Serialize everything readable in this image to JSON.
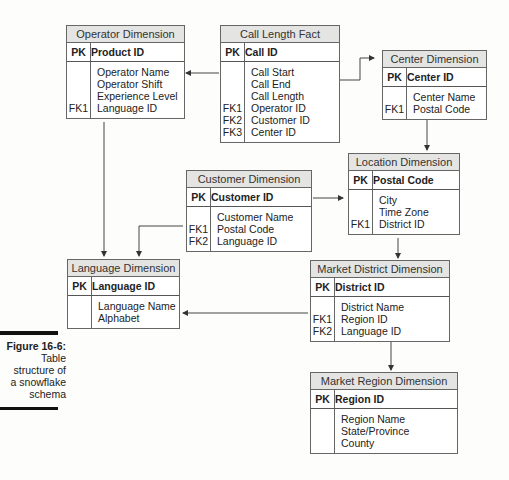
{
  "tables": {
    "operator": {
      "title": "Operator Dimension",
      "pk": {
        "key": "PK",
        "name": "Product ID"
      },
      "fields": [
        {
          "key": "",
          "name": "Operator Name"
        },
        {
          "key": "",
          "name": "Operator Shift"
        },
        {
          "key": "",
          "name": "Experience Level"
        },
        {
          "key": "FK1",
          "name": "Language ID"
        }
      ]
    },
    "call_length": {
      "title": "Call Length Fact",
      "pk": {
        "key": "PK",
        "name": "Call ID"
      },
      "fields": [
        {
          "key": "",
          "name": "Call Start"
        },
        {
          "key": "",
          "name": "Call End"
        },
        {
          "key": "",
          "name": "Call Length"
        },
        {
          "key": "FK1",
          "name": "Operator ID"
        },
        {
          "key": "FK2",
          "name": "Customer ID"
        },
        {
          "key": "FK3",
          "name": "Center ID"
        }
      ]
    },
    "center": {
      "title": "Center Dimension",
      "pk": {
        "key": "PK",
        "name": "Center ID"
      },
      "fields": [
        {
          "key": "",
          "name": "Center Name"
        },
        {
          "key": "FK1",
          "name": "Postal Code"
        }
      ]
    },
    "customer": {
      "title": "Customer Dimension",
      "pk": {
        "key": "PK",
        "name": "Customer ID"
      },
      "fields": [
        {
          "key": "",
          "name": "Customer Name"
        },
        {
          "key": "FK1",
          "name": "Postal Code"
        },
        {
          "key": "FK2",
          "name": "Language ID"
        }
      ]
    },
    "location": {
      "title": "Location Dimension",
      "pk": {
        "key": "PK",
        "name": "Postal Code"
      },
      "fields": [
        {
          "key": "",
          "name": "City"
        },
        {
          "key": "",
          "name": "Time Zone"
        },
        {
          "key": "FK1",
          "name": "District ID"
        }
      ]
    },
    "language": {
      "title": "Language Dimension",
      "pk": {
        "key": "PK",
        "name": "Language ID"
      },
      "fields": [
        {
          "key": "",
          "name": "Language Name"
        },
        {
          "key": "",
          "name": "Alphabet"
        }
      ]
    },
    "market_district": {
      "title": "Market District Dimension",
      "pk": {
        "key": "PK",
        "name": "District ID"
      },
      "fields": [
        {
          "key": "",
          "name": "District Name"
        },
        {
          "key": "FK1",
          "name": "Region ID"
        },
        {
          "key": "FK2",
          "name": "Language ID"
        }
      ]
    },
    "market_region": {
      "title": "Market Region Dimension",
      "pk": {
        "key": "PK",
        "name": "Region ID"
      },
      "fields": [
        {
          "key": "",
          "name": "Region Name"
        },
        {
          "key": "",
          "name": "State/Province"
        },
        {
          "key": "",
          "name": "County"
        }
      ]
    }
  },
  "caption": {
    "figure": "Figure 16-6:",
    "lines": [
      "Table",
      "structure of",
      "a snowflake",
      "schema"
    ]
  }
}
